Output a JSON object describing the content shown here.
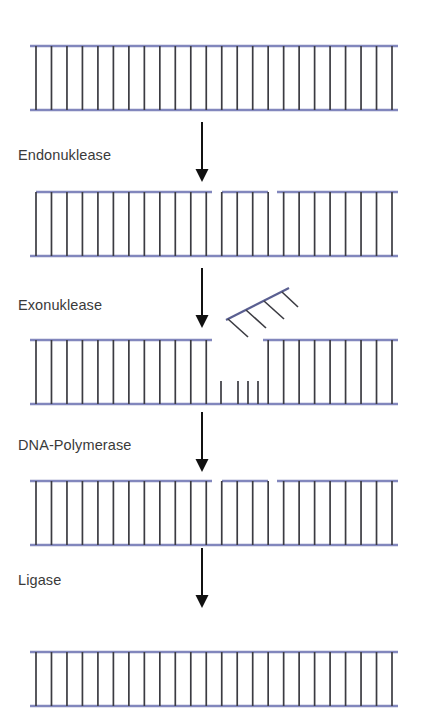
{
  "figure": {
    "language": "de",
    "background_color": "#ffffff",
    "backbone_color": "#8287bd",
    "rung_color": "#3b3b42",
    "arrow_color": "#111111",
    "label_color": "#3a3a3a",
    "width": 421,
    "height": 728
  },
  "steps": [
    {
      "id": "step-endonuclease",
      "label": "Endonuklease",
      "label_x": 18,
      "label_y": 160,
      "arrow_x": 202,
      "arrow_y1": 122,
      "arrow_y2": 182
    },
    {
      "id": "step-exonuklease",
      "label": "Exonuklease",
      "label_x": 18,
      "label_y": 310,
      "arrow_x": 202,
      "arrow_y1": 268,
      "arrow_y2": 328
    },
    {
      "id": "step-dna-polymerase",
      "label": "DNA-Polymerase",
      "label_x": 18,
      "label_y": 450,
      "arrow_x": 202,
      "arrow_y1": 412,
      "arrow_y2": 472
    },
    {
      "id": "step-ligase",
      "label": "Ligase",
      "label_x": 18,
      "label_y": 585,
      "arrow_x": 202,
      "arrow_y1": 548,
      "arrow_y2": 608
    }
  ],
  "dna_rows": [
    {
      "id": "dna-row-intact",
      "name": "intact-double-strand",
      "top_y": 46,
      "bottom_y": 110,
      "x_start": 30,
      "x_end": 398,
      "rung_count": 24,
      "rung_inset": 6,
      "top_segments": [
        [
          30,
          398
        ]
      ],
      "bottom_segments": [
        [
          30,
          398
        ]
      ],
      "stub_rungs": []
    },
    {
      "id": "dna-row-nicked",
      "name": "nicked-strand-after-endonuclease",
      "top_y": 192,
      "bottom_y": 256,
      "x_start": 30,
      "x_end": 398,
      "rung_count": 24,
      "rung_inset": 6,
      "top_segments": [
        [
          36,
          212
        ],
        [
          222,
          268
        ],
        [
          277,
          398
        ]
      ],
      "bottom_segments": [
        [
          30,
          398
        ]
      ],
      "stub_rungs": []
    },
    {
      "id": "dna-row-gapped",
      "name": "gapped-strand-after-exonuclease",
      "top_y": 340,
      "bottom_y": 404,
      "x_start": 30,
      "x_end": 398,
      "rung_count": 24,
      "rung_inset": 6,
      "top_segments": [
        [
          30,
          212
        ],
        [
          263,
          398
        ]
      ],
      "bottom_segments": [
        [
          30,
          398
        ]
      ],
      "stub_rungs": [
        221,
        238,
        248,
        258
      ]
    },
    {
      "id": "dna-row-filled",
      "name": "filled-strand-after-polymerase",
      "top_y": 481,
      "bottom_y": 545,
      "x_start": 30,
      "x_end": 398,
      "rung_count": 24,
      "rung_inset": 6,
      "top_segments": [
        [
          30,
          212
        ],
        [
          222,
          268
        ],
        [
          277,
          398
        ]
      ],
      "bottom_segments": [
        [
          30,
          398
        ]
      ],
      "stub_rungs": []
    },
    {
      "id": "dna-row-ligated",
      "name": "repaired-strand-after-ligase",
      "top_y": 652,
      "bottom_y": 706,
      "x_start": 30,
      "x_end": 398,
      "rung_count": 24,
      "rung_inset": 6,
      "top_segments": [
        [
          30,
          398
        ]
      ],
      "bottom_segments": [
        [
          30,
          398
        ]
      ],
      "stub_rungs": []
    }
  ],
  "excised_fragment": {
    "id": "excised-oligonucleotide",
    "name": "released-dna-fragment",
    "backbone": {
      "x1": 226,
      "y1": 320,
      "x2": 289,
      "y2": 288
    },
    "rungs": [
      {
        "x1": 228,
        "y1": 319,
        "x2": 248,
        "y2": 337
      },
      {
        "x1": 246,
        "y1": 310,
        "x2": 266,
        "y2": 328
      },
      {
        "x1": 264,
        "y1": 301,
        "x2": 284,
        "y2": 319
      },
      {
        "x1": 282,
        "y1": 292,
        "x2": 298,
        "y2": 307
      }
    ]
  },
  "caption": {
    "text": "",
    "visible": false
  }
}
